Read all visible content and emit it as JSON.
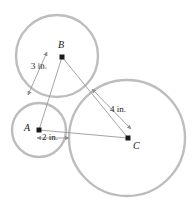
{
  "figure": {
    "colors": {
      "circle_stroke": "#b9b9b9",
      "segment_stroke": "#9a9a9a",
      "point_fill": "#1a1a1a",
      "label_color": "#1a1a1a",
      "background": "#ffffff"
    },
    "points": [
      {
        "id": "A",
        "label": "A",
        "x": 39,
        "y": 130,
        "label_x": 24,
        "label_y": 124
      },
      {
        "id": "B",
        "label": "B",
        "x": 62,
        "y": 57,
        "label_x": 57,
        "label_y": 41
      },
      {
        "id": "C",
        "label": "C",
        "x": 128,
        "y": 138,
        "label_x": 132,
        "label_y": 142
      }
    ],
    "circles": [
      {
        "id": "circle-A",
        "center": "A",
        "cx": 39,
        "cy": 130,
        "r": 27
      },
      {
        "id": "circle-B",
        "center": "B",
        "cx": 57,
        "cy": 56,
        "r": 41
      },
      {
        "id": "circle-C",
        "center": "C",
        "cx": 127,
        "cy": 138,
        "r": 58
      }
    ],
    "segments": [
      {
        "id": "segment-AB",
        "from": "A",
        "to": "B",
        "x1": 39,
        "y1": 130,
        "x2": 62,
        "y2": 57
      },
      {
        "id": "segment-BC",
        "from": "B",
        "to": "C",
        "x1": 62,
        "y1": 57,
        "x2": 128,
        "y2": 138
      },
      {
        "id": "segment-AC",
        "from": "A",
        "to": "C",
        "x1": 39,
        "y1": 130,
        "x2": 128,
        "y2": 138
      }
    ],
    "dimensions": [
      {
        "id": "dim-AB",
        "measures": "A to B",
        "value": "3",
        "unit": "in.",
        "text": "3 in.",
        "text_x": 32,
        "text_y": 66,
        "x1": 28,
        "y1": 95,
        "x2": 47,
        "y2": 52
      },
      {
        "id": "dim-BC",
        "measures": "B to C",
        "value": "4",
        "unit": "in.",
        "text": "4 in.",
        "text_x": 109,
        "text_y": 107,
        "x1": 92,
        "y1": 89,
        "x2": 131,
        "y2": 129
      },
      {
        "id": "dim-A-radius",
        "measures": "radius of circle A",
        "value": "2",
        "unit": "in.",
        "text": "2 in.",
        "text_x": 41,
        "text_y": 133,
        "x1": 37,
        "y1": 138,
        "x2": 69,
        "y2": 138
      }
    ]
  }
}
